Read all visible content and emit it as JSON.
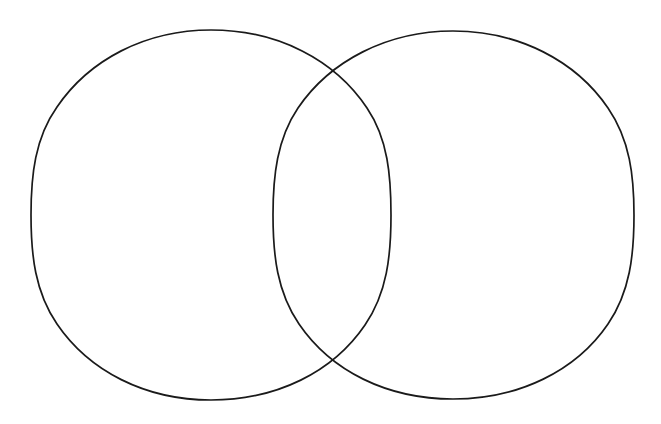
{
  "figure": {
    "kind": "venn-diagram",
    "title": "",
    "caption": "",
    "width": 661,
    "height": 424,
    "background_color": "#ffffff",
    "stroke_color": "#1a1a1a",
    "stroke_width": 1.7,
    "fill": "none",
    "style": "hand-drawn outline, unlabeled"
  },
  "chart_data": {
    "type": "venn",
    "title": "",
    "subtitle": "",
    "xlabel": "",
    "ylabel": "",
    "set_count": 2,
    "labels_present": false,
    "values_present": false,
    "legend": [],
    "annotations": [],
    "grid": false,
    "xlim": [
      0,
      661
    ],
    "ylim": [
      0,
      424
    ],
    "sets": [
      {
        "id": "left",
        "label": "",
        "value": "",
        "shape": "ellipse",
        "cx": 211,
        "cy": 215,
        "rx": 180,
        "ry": 185,
        "fill": "none",
        "stroke": "#1a1a1a"
      },
      {
        "id": "right",
        "label": "",
        "value": "",
        "shape": "ellipse",
        "cx": 453,
        "cy": 215,
        "rx": 181,
        "ry": 184,
        "fill": "none",
        "stroke": "#1a1a1a"
      }
    ],
    "regions": [
      {
        "id": "left-only",
        "label": "",
        "value": "",
        "center_x": 150,
        "center_y": 215
      },
      {
        "id": "intersection",
        "label": "",
        "value": "",
        "center_x": 332,
        "center_y": 215
      },
      {
        "id": "right-only",
        "label": "",
        "value": "",
        "center_x": 515,
        "center_y": 215
      }
    ],
    "intersection_points": [
      {
        "x": 335,
        "y": 72
      },
      {
        "x": 335,
        "y": 358
      }
    ]
  }
}
